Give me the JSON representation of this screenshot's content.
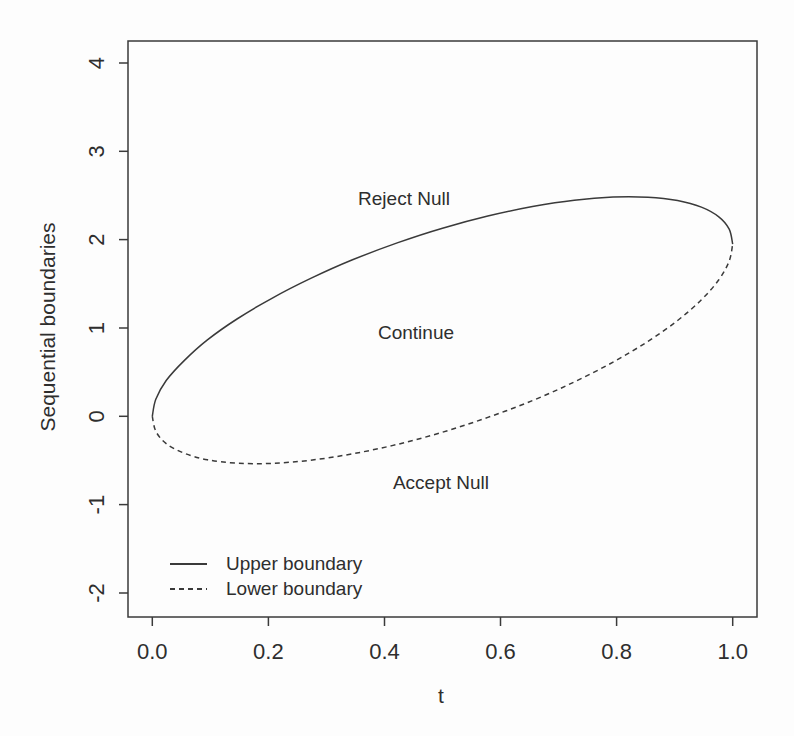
{
  "colors": {
    "line": "#3a3a3a",
    "text": "#2e2e2e",
    "background": "#fdfdfd"
  },
  "chart_data": {
    "type": "line",
    "title": "",
    "xlabel": "t",
    "ylabel": "Sequential boundaries",
    "xlim": [
      0,
      1
    ],
    "ylim": [
      -2,
      4
    ],
    "grid": false,
    "x_ticks": {
      "values": [
        0,
        0.2,
        0.4,
        0.6,
        0.8,
        1.0
      ],
      "labels": [
        "0.0",
        "0.2",
        "0.4",
        "0.6",
        "0.8",
        "1.0"
      ]
    },
    "y_ticks": {
      "values": [
        -2,
        -1,
        0,
        1,
        2,
        3,
        4
      ],
      "labels": [
        "-2",
        "-1",
        "0",
        "1",
        "2",
        "3",
        "4"
      ]
    },
    "series": [
      {
        "name": "Upper boundary",
        "style": "solid",
        "x": [
          0,
          0.006,
          0.024,
          0.055,
          0.095,
          0.146,
          0.206,
          0.273,
          0.345,
          0.422,
          0.5,
          0.578,
          0.655,
          0.727,
          0.794,
          0.854,
          0.905,
          0.946,
          0.976,
          0.994,
          1.0
        ],
        "y": [
          0,
          0.193,
          0.405,
          0.631,
          0.865,
          1.102,
          1.336,
          1.561,
          1.772,
          1.963,
          2.13,
          2.268,
          2.375,
          2.447,
          2.483,
          2.481,
          2.443,
          2.368,
          2.259,
          2.119,
          1.95
        ]
      },
      {
        "name": "Lower boundary",
        "style": "dashed",
        "x": [
          0,
          0.006,
          0.024,
          0.055,
          0.095,
          0.146,
          0.206,
          0.273,
          0.345,
          0.422,
          0.5,
          0.578,
          0.655,
          0.727,
          0.794,
          0.854,
          0.905,
          0.946,
          0.976,
          0.994,
          1.0
        ],
        "y": [
          0,
          -0.169,
          -0.309,
          -0.418,
          -0.493,
          -0.531,
          -0.533,
          -0.497,
          -0.425,
          -0.318,
          -0.18,
          -0.013,
          0.178,
          0.389,
          0.614,
          0.848,
          1.085,
          1.319,
          1.545,
          1.757,
          1.95
        ]
      }
    ],
    "annotations": [
      {
        "text": "Reject Null",
        "x": 0.434,
        "y": 2.46
      },
      {
        "text": "Continue",
        "x": 0.454,
        "y": 0.94
      },
      {
        "text": "Accept Null",
        "x": 0.497,
        "y": -0.76
      }
    ],
    "legend": {
      "position": "bottom-left-inside",
      "entries": [
        {
          "label": "Upper boundary",
          "style": "solid"
        },
        {
          "label": "Lower boundary",
          "style": "dashed"
        }
      ]
    }
  }
}
